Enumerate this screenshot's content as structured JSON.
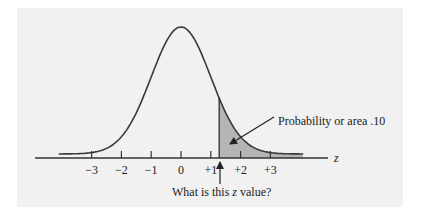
{
  "figure": {
    "background": "#f1f1f1",
    "curve_color": "#3a3a3a",
    "shade_color": "#b5b5b5",
    "axis_label": "z",
    "ticks": [
      "−3",
      "−2",
      "−1",
      "0",
      "+1",
      "+2",
      "+3"
    ],
    "annotations": {
      "area_label": "Probability or area .10",
      "question_label_prefix": "What is this ",
      "question_label_var": "z",
      "question_label_suffix": " value?"
    }
  },
  "chart_data": {
    "type": "area",
    "title": "",
    "xlabel": "z",
    "ylabel": "",
    "x_ticks": [
      -3,
      -2,
      -1,
      0,
      1,
      2,
      3
    ],
    "tick_labels": [
      "−3",
      "−2",
      "−1",
      "0",
      "+1",
      "+2",
      "+3"
    ],
    "xlim": [
      -4,
      4
    ],
    "grid": false,
    "distribution": {
      "name": "standard normal",
      "mean": 0,
      "sd": 1
    },
    "shaded_region": {
      "from_z": 1.28,
      "to_z": 4,
      "area": 0.1
    },
    "annotations": [
      {
        "text": "Probability or area .10",
        "points_to": "shaded region"
      },
      {
        "text": "What is this z value?",
        "points_to": "left boundary of shaded region (z ≈ 1.28)"
      }
    ]
  }
}
